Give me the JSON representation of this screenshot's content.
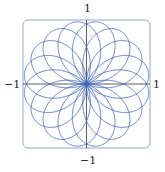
{
  "chart_data": {
    "type": "line",
    "title": "",
    "equation": {
      "k_num": 8,
      "k_den": 5,
      "theta_max_pi": 10
    },
    "xlim": [
      -1,
      1
    ],
    "ylim": [
      -1,
      1
    ],
    "xlabel": "",
    "ylabel": "",
    "tick_labels": {
      "top": "1",
      "bottom": "−1",
      "left": "−1",
      "right": "1"
    },
    "grid": false,
    "legend": null,
    "colors": {
      "curve": "#3a5fb5",
      "axes": "#333333",
      "frame": "#9aa6c8"
    }
  }
}
